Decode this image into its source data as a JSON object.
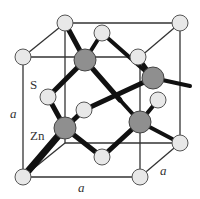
{
  "labels": {
    "sulfur": "S",
    "zinc": "Zn",
    "lattice_vertical": "a",
    "lattice_bottom": "a",
    "lattice_depth": "a"
  },
  "colors": {
    "sulfur_fill": "#e8e8e8",
    "zinc_fill": "#8f8f8f",
    "edge": "#333333",
    "bond": "#111111"
  }
}
